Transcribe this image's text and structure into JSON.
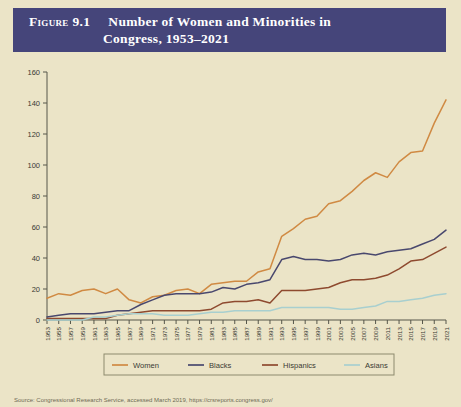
{
  "figure": {
    "label": "Figure",
    "number": "9.1",
    "title_line1": "Number of Women and Minorities in",
    "title_line2": "Congress, 1953–2021",
    "banner_color": "#45457a",
    "page_background": "#ebe4c7"
  },
  "source": {
    "text": "Source: Congressional Research Service, accessed March 2019, https://crsreports.congress.gov/"
  },
  "chart_data": {
    "type": "line",
    "title": "Number of Women and Minorities in Congress, 1953–2021",
    "xlabel": "",
    "ylabel": "",
    "xlim": [
      1953,
      2021
    ],
    "ylim": [
      0,
      160
    ],
    "ytick_step": 20,
    "grid": false,
    "legend_position": "bottom",
    "x": [
      1953,
      1955,
      1957,
      1959,
      1961,
      1963,
      1965,
      1967,
      1969,
      1971,
      1973,
      1975,
      1977,
      1979,
      1981,
      1983,
      1985,
      1987,
      1989,
      1991,
      1993,
      1995,
      1997,
      1999,
      2001,
      2003,
      2005,
      2007,
      2009,
      2011,
      2013,
      2015,
      2017,
      2019,
      2021
    ],
    "yticks": [
      0,
      20,
      40,
      60,
      80,
      100,
      120,
      140,
      160
    ],
    "xticks": [
      "1953",
      "1955",
      "1957",
      "1959",
      "1961",
      "1963",
      "1965",
      "1967",
      "1969",
      "1971",
      "1973",
      "1975",
      "1977",
      "1979",
      "1981",
      "1983",
      "1985",
      "1987",
      "1989",
      "1991",
      "1993",
      "1995",
      "1997",
      "1999",
      "2001",
      "2003",
      "2005",
      "2007",
      "2009",
      "2011",
      "2013",
      "2015",
      "2017",
      "2019",
      "2021"
    ],
    "series": [
      {
        "name": "Women",
        "color": "#d08a43",
        "values": [
          14,
          17,
          16,
          19,
          20,
          17,
          20,
          13,
          11,
          15,
          16,
          19,
          20,
          17,
          23,
          24,
          25,
          25,
          31,
          33,
          54,
          59,
          65,
          67,
          75,
          77,
          83,
          90,
          95,
          92,
          102,
          108,
          109,
          127,
          142
        ]
      },
      {
        "name": "Blacks",
        "color": "#49486e",
        "values": [
          2,
          3,
          4,
          4,
          4,
          5,
          6,
          6,
          10,
          13,
          16,
          17,
          17,
          17,
          18,
          21,
          20,
          23,
          24,
          26,
          39,
          41,
          39,
          39,
          38,
          39,
          42,
          43,
          42,
          44,
          45,
          46,
          49,
          52,
          58
        ]
      },
      {
        "name": "Hispanics",
        "color": "#8e4a2f",
        "values": [
          1,
          1,
          1,
          1,
          1,
          1,
          3,
          4,
          5,
          6,
          6,
          6,
          6,
          6,
          7,
          11,
          12,
          12,
          13,
          11,
          19,
          19,
          19,
          20,
          21,
          24,
          26,
          26,
          27,
          29,
          33,
          38,
          39,
          43,
          47
        ]
      },
      {
        "name": "Asians",
        "color": "#a8cfcf",
        "values": [
          0,
          0,
          0,
          0,
          2,
          2,
          3,
          4,
          4,
          4,
          3,
          3,
          3,
          4,
          5,
          5,
          6,
          6,
          6,
          6,
          8,
          8,
          8,
          8,
          8,
          7,
          7,
          8,
          9,
          12,
          12,
          13,
          14,
          16,
          17
        ]
      }
    ]
  }
}
